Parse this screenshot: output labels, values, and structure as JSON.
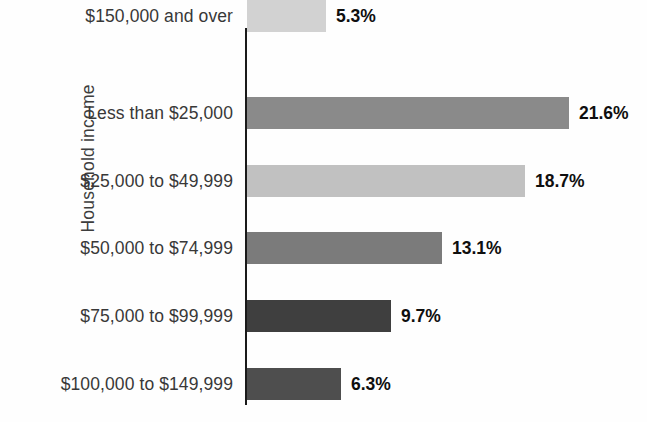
{
  "chart_data": {
    "type": "bar",
    "orientation": "horizontal",
    "title": "",
    "xlabel": "",
    "ylabel": "Household income",
    "categories": [
      "Less than $25,000",
      "$25,000 to $49,999",
      "$50,000 to $74,999",
      "$75,000 to $99,999",
      "$100,000 to $149,999",
      "$150,000 and over"
    ],
    "values": [
      21.6,
      18.7,
      13.1,
      9.7,
      6.3,
      5.3
    ],
    "value_labels": [
      "21.6%",
      "18.7%",
      "13.1%",
      "9.7%",
      "6.3%",
      "5.3%"
    ],
    "bar_colors": [
      "#8a8a8a",
      "#c1c1c1",
      "#7b7b7b",
      "#3f3f3f",
      "#4e4e4e",
      "#d2d2d2"
    ],
    "xlim": [
      0,
      27
    ],
    "grid": false,
    "legend": null,
    "value_labels_position": "right-of-bar",
    "axis_color": "#1a1a1a"
  }
}
